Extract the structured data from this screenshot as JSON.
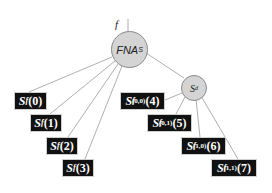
{
  "diagram": {
    "input_label": "f",
    "root": {
      "label": "FNA",
      "subscript": "S",
      "fill": "#d4d4d4"
    },
    "internal": {
      "label": "S",
      "subscript": "d",
      "fill": "#d4d4d4"
    },
    "left_leaves": [
      {
        "base": "S",
        "sub": "f",
        "sup": "",
        "index": "(0)"
      },
      {
        "base": "S",
        "sub": "f",
        "sup": "",
        "index": "(1)"
      },
      {
        "base": "S",
        "sub": "f",
        "sup": "",
        "index": "(2)"
      },
      {
        "base": "S",
        "sub": "f",
        "sup": "",
        "index": "(3)"
      }
    ],
    "right_leaves": [
      {
        "base": "S",
        "sub": "f",
        "sup": "(0,0)",
        "index": "(4)"
      },
      {
        "base": "S",
        "sub": "f",
        "sup": "(0,1)",
        "index": "(5)"
      },
      {
        "base": "S",
        "sub": "f",
        "sup": "(1,0)",
        "index": "(6)"
      },
      {
        "base": "S",
        "sub": "f",
        "sup": "(1,1)",
        "index": "(7)"
      }
    ],
    "colors": {
      "leaf_bg": "#111111",
      "leaf_text": "#ffffff",
      "edge": "#9a9a9a",
      "node_border": "#8a8a8a"
    }
  }
}
